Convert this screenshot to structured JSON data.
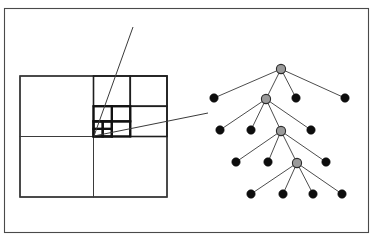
{
  "figure": {
    "background_color": "#ffffff",
    "frame": {
      "label": "figure-border",
      "x": 4.5,
      "y": 8.5,
      "width": 364,
      "height": 224,
      "stroke_color": "#4a4a4a"
    }
  },
  "quadtree_panel": {
    "label": "quadtree-subdivision",
    "square": {
      "x": 20,
      "y": 76,
      "width": 147,
      "height": 121
    },
    "colors": {
      "outer_stroke": "#262626",
      "thin_stroke": "#3b3b3b",
      "medium_stroke": "#1e1e1e",
      "thick_stroke": "#111111"
    },
    "levels": [
      {
        "level": 0,
        "name": "root-square",
        "cells": [
          {
            "name": "nw-quadrant",
            "x": 20,
            "y": 76,
            "w": 73.5,
            "h": 60.5
          },
          {
            "name": "ne-quadrant",
            "x": 93.5,
            "y": 76,
            "w": 73.5,
            "h": 60.5
          },
          {
            "name": "sw-quadrant",
            "x": 20,
            "y": 136.5,
            "w": 73.5,
            "h": 60.5
          },
          {
            "name": "se-quadrant",
            "x": 93.5,
            "y": 136.5,
            "w": 73.5,
            "h": 60.5
          }
        ]
      },
      {
        "level": 1,
        "name": "ne-subdivision",
        "cells": [
          {
            "name": "ne-nw",
            "x": 93.5,
            "y": 76,
            "w": 36.75,
            "h": 30.25
          },
          {
            "name": "ne-ne",
            "x": 130.25,
            "y": 76,
            "w": 36.75,
            "h": 30.25
          },
          {
            "name": "ne-sw",
            "x": 93.5,
            "y": 106.25,
            "w": 36.75,
            "h": 30.25
          },
          {
            "name": "ne-se",
            "x": 130.25,
            "y": 106.25,
            "w": 36.75,
            "h": 30.25
          }
        ]
      },
      {
        "level": 2,
        "name": "ne-sw-subdivision",
        "cells": [
          {
            "name": "ne-sw-nw",
            "x": 93.5,
            "y": 106.25,
            "w": 18.4,
            "h": 15.1
          },
          {
            "name": "ne-sw-ne",
            "x": 111.9,
            "y": 106.25,
            "w": 18.4,
            "h": 15.1
          },
          {
            "name": "ne-sw-sw",
            "x": 93.5,
            "y": 121.35,
            "w": 18.4,
            "h": 15.1
          },
          {
            "name": "ne-sw-se",
            "x": 111.9,
            "y": 121.35,
            "w": 18.4,
            "h": 15.1
          }
        ]
      },
      {
        "level": 3,
        "name": "ne-sw-sw-subdivision",
        "cells": [
          {
            "name": "ne-sw-sw-nw",
            "x": 93.5,
            "y": 121.35,
            "w": 9.2,
            "h": 7.55
          },
          {
            "name": "ne-sw-sw-ne",
            "x": 102.7,
            "y": 121.35,
            "w": 9.2,
            "h": 7.55
          },
          {
            "name": "ne-sw-sw-sw",
            "x": 93.5,
            "y": 128.9,
            "w": 9.2,
            "h": 7.55
          },
          {
            "name": "ne-sw-sw-se",
            "x": 102.7,
            "y": 128.9,
            "w": 9.2,
            "h": 7.55
          }
        ]
      }
    ]
  },
  "leader_lines": {
    "label": "zoom-leader-lines",
    "stroke_color": "#3a3a3a",
    "lines": [
      {
        "name": "leader-upper",
        "x1": 94,
        "y1": 136,
        "x2": 133,
        "y2": 27
      },
      {
        "name": "leader-lower",
        "x1": 94,
        "y1": 136,
        "x2": 208,
        "y2": 113
      }
    ]
  },
  "tree_panel": {
    "label": "quadtree-node-tree",
    "colors": {
      "edge": "#4d4d4d",
      "leaf_fill": "#0d0d0d",
      "internal_fill": "#9a9a9a",
      "internal_stroke": "#2b2b2b"
    },
    "node_radius": {
      "leaf": 4.2,
      "internal": 4.6
    },
    "nodes": [
      {
        "id": "root",
        "name": "tree-node-root",
        "type": "internal",
        "x": 281,
        "y": 69,
        "depth": 0
      },
      {
        "id": "n1a",
        "name": "tree-leaf-l1-1",
        "type": "leaf",
        "x": 214,
        "y": 98,
        "depth": 1
      },
      {
        "id": "n1b",
        "name": "tree-node-l1-2",
        "type": "internal",
        "x": 266,
        "y": 99,
        "depth": 1
      },
      {
        "id": "n1c",
        "name": "tree-leaf-l1-3",
        "type": "leaf",
        "x": 296,
        "y": 98,
        "depth": 1
      },
      {
        "id": "n1d",
        "name": "tree-leaf-l1-4",
        "type": "leaf",
        "x": 345,
        "y": 98,
        "depth": 1
      },
      {
        "id": "n2a",
        "name": "tree-leaf-l2-1",
        "type": "leaf",
        "x": 220,
        "y": 130,
        "depth": 2
      },
      {
        "id": "n2b",
        "name": "tree-leaf-l2-2",
        "type": "leaf",
        "x": 251,
        "y": 130,
        "depth": 2
      },
      {
        "id": "n2c",
        "name": "tree-node-l2-3",
        "type": "internal",
        "x": 281,
        "y": 131,
        "depth": 2
      },
      {
        "id": "n2d",
        "name": "tree-leaf-l2-4",
        "type": "leaf",
        "x": 311,
        "y": 130,
        "depth": 2
      },
      {
        "id": "n3a",
        "name": "tree-leaf-l3-1",
        "type": "leaf",
        "x": 236,
        "y": 162,
        "depth": 3
      },
      {
        "id": "n3b",
        "name": "tree-leaf-l3-2",
        "type": "leaf",
        "x": 268,
        "y": 162,
        "depth": 3
      },
      {
        "id": "n3c",
        "name": "tree-node-l3-3",
        "type": "internal",
        "x": 297,
        "y": 163,
        "depth": 3
      },
      {
        "id": "n3d",
        "name": "tree-leaf-l3-4",
        "type": "leaf",
        "x": 326,
        "y": 162,
        "depth": 3
      },
      {
        "id": "n4a",
        "name": "tree-leaf-l4-1",
        "type": "leaf",
        "x": 251,
        "y": 194,
        "depth": 4
      },
      {
        "id": "n4b",
        "name": "tree-leaf-l4-2",
        "type": "leaf",
        "x": 283,
        "y": 194,
        "depth": 4
      },
      {
        "id": "n4c",
        "name": "tree-leaf-l4-3",
        "type": "leaf",
        "x": 313,
        "y": 194,
        "depth": 4
      },
      {
        "id": "n4d",
        "name": "tree-leaf-l4-4",
        "type": "leaf",
        "x": 342,
        "y": 194,
        "depth": 4
      }
    ],
    "edges": [
      {
        "name": "edge-root-n1a",
        "from": "root",
        "to": "n1a"
      },
      {
        "name": "edge-root-n1b",
        "from": "root",
        "to": "n1b"
      },
      {
        "name": "edge-root-n1c",
        "from": "root",
        "to": "n1c"
      },
      {
        "name": "edge-root-n1d",
        "from": "root",
        "to": "n1d"
      },
      {
        "name": "edge-n1b-n2a",
        "from": "n1b",
        "to": "n2a"
      },
      {
        "name": "edge-n1b-n2b",
        "from": "n1b",
        "to": "n2b"
      },
      {
        "name": "edge-n1b-n2c",
        "from": "n1b",
        "to": "n2c"
      },
      {
        "name": "edge-n1b-n2d",
        "from": "n1b",
        "to": "n2d"
      },
      {
        "name": "edge-n2c-n3a",
        "from": "n2c",
        "to": "n3a"
      },
      {
        "name": "edge-n2c-n3b",
        "from": "n2c",
        "to": "n3b"
      },
      {
        "name": "edge-n2c-n3c",
        "from": "n2c",
        "to": "n3c"
      },
      {
        "name": "edge-n2c-n3d",
        "from": "n2c",
        "to": "n3d"
      },
      {
        "name": "edge-n3c-n4a",
        "from": "n3c",
        "to": "n4a"
      },
      {
        "name": "edge-n3c-n4b",
        "from": "n3c",
        "to": "n4b"
      },
      {
        "name": "edge-n3c-n4c",
        "from": "n3c",
        "to": "n4c"
      },
      {
        "name": "edge-n3c-n4d",
        "from": "n3c",
        "to": "n4d"
      }
    ]
  }
}
